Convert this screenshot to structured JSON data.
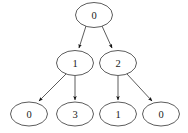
{
  "diagram": {
    "kind": "tree-diagram",
    "background_color": "#ffffff",
    "node_stroke_color": "#4a4a4a",
    "node_fill_color": "#ffffff",
    "label_color": "#1a1a1a",
    "arrow_color": "#111111"
  },
  "nodes": [
    {
      "id": "root",
      "label": "0",
      "cx": 94,
      "cy": 15,
      "rx": 18.5,
      "ry": 12.5,
      "level": 0
    },
    {
      "id": "n1",
      "label": "1",
      "cx": 75,
      "cy": 63,
      "rx": 18.5,
      "ry": 12.5,
      "level": 1
    },
    {
      "id": "n2",
      "label": "2",
      "cx": 118,
      "cy": 63,
      "rx": 18.5,
      "ry": 12.5,
      "level": 1
    },
    {
      "id": "leaf1",
      "label": "0",
      "cx": 29,
      "cy": 114,
      "rx": 18.5,
      "ry": 12.0,
      "level": 2
    },
    {
      "id": "leaf2",
      "label": "3",
      "cx": 75,
      "cy": 114,
      "rx": 18.5,
      "ry": 12.0,
      "level": 2
    },
    {
      "id": "leaf3",
      "label": "1",
      "cx": 118,
      "cy": 114,
      "rx": 18.5,
      "ry": 12.0,
      "level": 2
    },
    {
      "id": "leaf4",
      "label": "0",
      "cx": 161,
      "cy": 114,
      "rx": 18.5,
      "ry": 12.0,
      "level": 2
    }
  ],
  "edges": [
    {
      "id": "e-root-n1",
      "from": "root",
      "to": "n1",
      "x1": 86,
      "y1": 26,
      "x2": 79,
      "y2": 48,
      "arrow": true
    },
    {
      "id": "e-root-n2",
      "from": "root",
      "to": "n2",
      "x1": 102,
      "y1": 26,
      "x2": 112,
      "y2": 48,
      "arrow": true
    },
    {
      "id": "e-n1-leaf1",
      "from": "n1",
      "to": "leaf1",
      "x1": 66,
      "y1": 74,
      "x2": 39,
      "y2": 101,
      "arrow": true
    },
    {
      "id": "e-n1-leaf2",
      "from": "n1",
      "to": "leaf2",
      "x1": 75,
      "y1": 76,
      "x2": 75,
      "y2": 100,
      "arrow": true
    },
    {
      "id": "e-n2-leaf3",
      "from": "n2",
      "to": "leaf3",
      "x1": 118,
      "y1": 76,
      "x2": 118,
      "y2": 100,
      "arrow": true
    },
    {
      "id": "e-n2-leaf4",
      "from": "n2",
      "to": "leaf4",
      "x1": 127,
      "y1": 74,
      "x2": 152,
      "y2": 101,
      "arrow": true
    }
  ]
}
